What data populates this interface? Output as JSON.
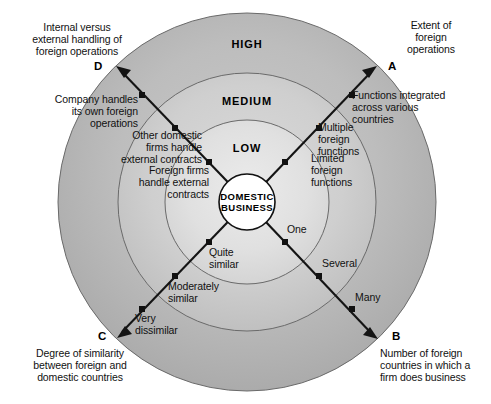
{
  "figure": {
    "center": {
      "label": "DOMESTIC\nBUSINESS"
    },
    "rings": [
      {
        "id": "low",
        "label": "LOW"
      },
      {
        "id": "medium",
        "label": "MEDIUM"
      },
      {
        "id": "high",
        "label": "HIGH"
      }
    ],
    "axes": [
      {
        "id": "A",
        "letter": "A",
        "caption": "Extent of\nforeign\noperations",
        "ticks": [
          {
            "label": "Limited\nforeign\nfunctions"
          },
          {
            "label": "Multiple\nforeign\nfunctions"
          },
          {
            "label": "Functions integrated\nacross various\ncountries"
          }
        ]
      },
      {
        "id": "B",
        "letter": "B",
        "caption": "Number of foreign\ncountries in which a\nfirm does business",
        "ticks": [
          {
            "label": "One"
          },
          {
            "label": "Several"
          },
          {
            "label": "Many"
          }
        ]
      },
      {
        "id": "C",
        "letter": "C",
        "caption": "Degree of similarity\nbetween foreign and\ndomestic countries",
        "ticks": [
          {
            "label": "Quite\nsimilar"
          },
          {
            "label": "Moderately\nsimilar"
          },
          {
            "label": "Very\ndissimilar"
          }
        ]
      },
      {
        "id": "D",
        "letter": "D",
        "caption": "Internal versus\nexternal handling of\nforeign operations",
        "ticks": [
          {
            "label": "Foreign firms\nhandle external\ncontracts"
          },
          {
            "label": "Other domestic\nfirms handle\nexternal contracts"
          },
          {
            "label": "Company handles\nits own foreign\noperations"
          }
        ]
      }
    ],
    "colors": {
      "ring_outer": "#b4b4b4",
      "ring_middle": "#c8c8c8",
      "ring_inner": "#dcdcdc",
      "center_fill": "#ffffff",
      "stroke": "#4a4a4a",
      "axis_line": "#111111",
      "background": "#ffffff"
    }
  }
}
